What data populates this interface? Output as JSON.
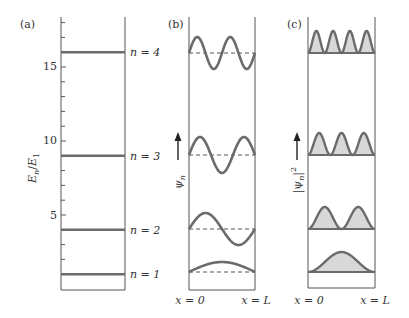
{
  "figure": {
    "panels": [
      {
        "id": "a",
        "label": "(a)",
        "type": "energy-level-diagram",
        "y_axis_label_main": "E",
        "y_axis_label_sub_n": "n",
        "y_axis_label_slash": "/",
        "y_axis_label_den": "E",
        "y_axis_label_sub_1": "1",
        "y_ticks": [
          "5",
          "10",
          "15"
        ],
        "levels": [
          {
            "n_label": "n = 1",
            "energy": 1
          },
          {
            "n_label": "n = 2",
            "energy": 4
          },
          {
            "n_label": "n = 3",
            "energy": 9
          },
          {
            "n_label": "n = 4",
            "energy": 16
          }
        ]
      },
      {
        "id": "b",
        "label": "(b)",
        "type": "wavefunctions",
        "axis_label": "ψ",
        "axis_label_sub": "n",
        "x_left_label": "x = 0",
        "x_right_label": "x = L"
      },
      {
        "id": "c",
        "label": "(c)",
        "type": "probability-densities",
        "axis_label": "|ψ",
        "axis_label_sub": "n",
        "axis_label_end": "|",
        "axis_label_sup": "2",
        "x_left_label": "x = 0",
        "x_right_label": "x = L"
      }
    ],
    "colors": {
      "curve": "#6b6b6b",
      "frame": "#555555",
      "fill": "#d8d8d8",
      "text": "#333333"
    }
  },
  "chart_data": {
    "type": "diagram",
    "panel_a": {
      "ylabel": "E_n/E_1",
      "ylim": [
        0,
        18
      ],
      "yticks": [
        5,
        10,
        15
      ],
      "levels": [
        {
          "n": 1,
          "E": 1
        },
        {
          "n": 2,
          "E": 4
        },
        {
          "n": 3,
          "E": 9
        },
        {
          "n": 4,
          "E": 16
        }
      ]
    },
    "panel_b": {
      "ylabel": "ψ_n",
      "functions": [
        "sin(nπx/L)",
        "n=1..4"
      ],
      "xlabels": [
        "x = 0",
        "x = L"
      ]
    },
    "panel_c": {
      "ylabel": "|ψ_n|^2",
      "functions": [
        "sin^2(nπx/L)",
        "n=1..4"
      ],
      "xlabels": [
        "x = 0",
        "x = L"
      ]
    }
  }
}
